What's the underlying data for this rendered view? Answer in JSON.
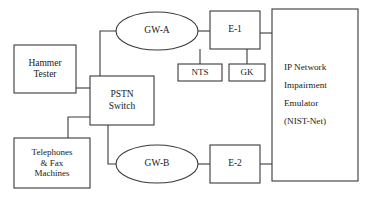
{
  "diagram": {
    "stroke_color": "#3a3a3a",
    "text_color": "#1a1a1a",
    "background": "#ffffff",
    "nodes": [
      {
        "id": "hammer-tester",
        "shape": "rect",
        "label": "Hammer\nTester",
        "lines": [
          "Hammer",
          "Tester"
        ],
        "x": 14,
        "y": 45,
        "w": 62,
        "h": 48
      },
      {
        "id": "telephones-fax-machines",
        "shape": "rect",
        "label": "Telephones\n& Fax\nMachines",
        "lines": [
          "Telephones",
          "& Fax",
          "Machines"
        ],
        "x": 14,
        "y": 138,
        "w": 76,
        "h": 50
      },
      {
        "id": "pstn-switch",
        "shape": "rect",
        "label": "PSTN\nSwitch",
        "lines": [
          "PSTN",
          "Switch"
        ],
        "x": 90,
        "y": 76,
        "w": 64,
        "h": 49
      },
      {
        "id": "gw-a",
        "shape": "ellipse",
        "label": "GW-A",
        "lines": [
          "GW-A"
        ],
        "x": 116,
        "y": 12,
        "w": 82,
        "h": 38
      },
      {
        "id": "gw-b",
        "shape": "ellipse",
        "label": "GW-B",
        "lines": [
          "GW-B"
        ],
        "x": 116,
        "y": 145,
        "w": 82,
        "h": 38
      },
      {
        "id": "e-1",
        "shape": "rect",
        "label": "E-1",
        "lines": [
          "E-1"
        ],
        "x": 210,
        "y": 11,
        "w": 50,
        "h": 38
      },
      {
        "id": "e-2",
        "shape": "rect",
        "label": "E-2",
        "lines": [
          "E-2"
        ],
        "x": 210,
        "y": 145,
        "w": 50,
        "h": 38
      },
      {
        "id": "nts",
        "shape": "rect",
        "label": "NTS",
        "lines": [
          "NTS"
        ],
        "x": 178,
        "y": 64,
        "w": 44,
        "h": 17
      },
      {
        "id": "gk",
        "shape": "rect",
        "label": "GK",
        "lines": [
          "GK"
        ],
        "x": 229,
        "y": 64,
        "w": 36,
        "h": 17
      },
      {
        "id": "ip-network-impairment-emulator",
        "shape": "rect",
        "label": "IP Network\nImpairment\nEmulator\n(NIST-Net)",
        "lines": [
          "IP Network",
          "Impairment",
          "Emulator",
          "(NIST-Net)"
        ],
        "x": 272,
        "y": 9,
        "w": 86,
        "h": 172
      }
    ],
    "connections": [
      {
        "id": "hammer-tester-to-pstn-switch",
        "from": "hammer-tester",
        "to": "pstn-switch",
        "path": "M76,88 L90,88"
      },
      {
        "id": "telephones-to-pstn-switch",
        "from": "telephones-fax-machines",
        "to": "pstn-switch",
        "path": "M90,150 L68,150"
      },
      {
        "id": "telephones-elbow",
        "from": "telephones-fax-machines",
        "to": "pstn-switch",
        "path": "M68,150 L68,117 L90,117"
      },
      {
        "id": "pstn-switch-to-gw-a",
        "from": "pstn-switch",
        "to": "gw-a",
        "path": "M100,76 L100,31 L117,31"
      },
      {
        "id": "pstn-switch-to-gw-b",
        "from": "pstn-switch",
        "to": "gw-b",
        "path": "M108,125 L108,164 L117,164"
      },
      {
        "id": "gw-a-to-e-1",
        "from": "gw-a",
        "to": "e-1",
        "path": "M198,31 L210,31"
      },
      {
        "id": "gw-b-to-e-2",
        "from": "gw-b",
        "to": "e-2",
        "path": "M198,164 L210,164"
      },
      {
        "id": "e-1-to-nts",
        "from": "e-1",
        "to": "nts",
        "path": "M200,49 L200,64"
      },
      {
        "id": "e-1-to-gk",
        "from": "e-1",
        "to": "gk",
        "path": "M247,49 L247,64"
      },
      {
        "id": "e-1-to-emulator",
        "from": "e-1",
        "to": "ip-network-impairment-emulator",
        "path": "M260,33 L272,33"
      },
      {
        "id": "e-2-to-emulator",
        "from": "e-2",
        "to": "ip-network-impairment-emulator",
        "path": "M260,164 L272,164"
      }
    ]
  }
}
